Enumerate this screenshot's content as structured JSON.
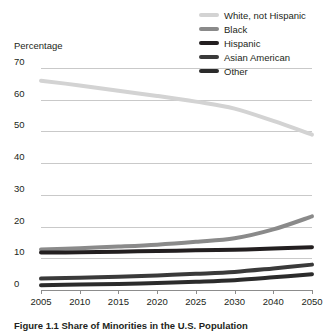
{
  "axis_title": "Percentage",
  "caption": "Figure 1.1  Share of Minorities in the U.S. Population",
  "legend": {
    "position": "top-right",
    "items": [
      {
        "label": "White, not Hispanic",
        "color": "#d3d3d3"
      },
      {
        "label": "Black",
        "color": "#8a8a8a"
      },
      {
        "label": "Hispanic",
        "color": "#231f20"
      },
      {
        "label": "Asian American",
        "color": "#3a3a3a"
      },
      {
        "label": "Other",
        "color": "#2b2b2b"
      }
    ]
  },
  "chart_data": {
    "type": "line",
    "title": "Figure 1.1  Share of Minorities in the U.S. Population",
    "xlabel": "",
    "ylabel": "Percentage",
    "grid": true,
    "legend_position": "top-right",
    "categories": [
      "2005",
      "2010",
      "2015",
      "2020",
      "2025",
      "2030",
      "2040",
      "2050"
    ],
    "x": [
      2005,
      2010,
      2015,
      2020,
      2025,
      2030,
      2040,
      2050
    ],
    "xlim": [
      2005,
      2050
    ],
    "ylim": [
      0,
      70
    ],
    "yticks": [
      0,
      10,
      20,
      30,
      40,
      50,
      60,
      70
    ],
    "xticks": [
      "2005",
      "2010",
      "2015",
      "2020",
      "2025",
      "2030",
      "2040",
      "2050"
    ],
    "series": [
      {
        "name": "White, not Hispanic",
        "color": "#d3d3d3",
        "values": [
          66.0,
          64.5,
          62.8,
          61.2,
          59.4,
          57.2,
          53.3,
          49.0
        ]
      },
      {
        "name": "Black",
        "color": "#8a8a8a",
        "values": [
          12.8,
          13.2,
          13.7,
          14.3,
          15.2,
          16.3,
          19.1,
          23.2
        ]
      },
      {
        "name": "Hispanic",
        "color": "#231f20",
        "values": [
          11.8,
          11.9,
          12.1,
          12.3,
          12.5,
          12.7,
          13.1,
          13.5
        ]
      },
      {
        "name": "Asian American",
        "color": "#3a3a3a",
        "values": [
          3.6,
          3.9,
          4.2,
          4.6,
          5.1,
          5.7,
          6.8,
          8.0
        ]
      },
      {
        "name": "Other",
        "color": "#2b2b2b",
        "values": [
          1.5,
          1.7,
          1.9,
          2.2,
          2.6,
          3.1,
          4.0,
          5.0
        ]
      }
    ]
  }
}
